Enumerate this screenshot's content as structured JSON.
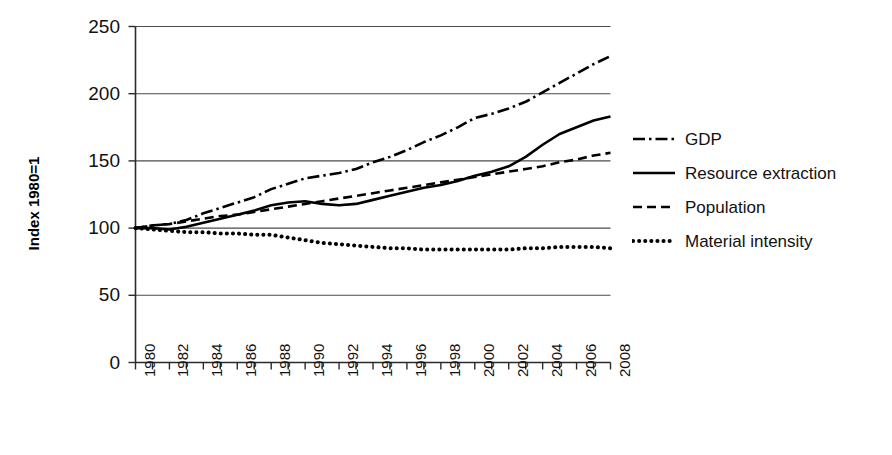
{
  "chart_data": {
    "type": "line",
    "title": "",
    "subtitle": "",
    "xlabel": "",
    "ylabel": "Index 1980=1",
    "ylim": [
      0,
      250
    ],
    "ytick_step": 50,
    "ytick_labels": [
      "0",
      "50",
      "100",
      "150",
      "200",
      "250"
    ],
    "ytick_values": [
      0,
      50,
      100,
      150,
      200,
      250
    ],
    "xlim": [
      1980,
      2008
    ],
    "xtick_labels": [
      "1980",
      "1982",
      "1984",
      "1986",
      "1988",
      "1990",
      "1992",
      "1994",
      "1996",
      "1998",
      "2000",
      "2002",
      "2004",
      "2006",
      "2008"
    ],
    "xtick_values": [
      1980,
      1982,
      1984,
      1986,
      1988,
      1990,
      1992,
      1994,
      1996,
      1998,
      2000,
      2002,
      2004,
      2006,
      2008
    ],
    "xtick_minor_step": 1,
    "xtick_label_rotation": -90,
    "grid": "horizontal",
    "legend_position": "right",
    "x": [
      1980,
      1981,
      1982,
      1983,
      1984,
      1985,
      1986,
      1987,
      1988,
      1989,
      1990,
      1991,
      1992,
      1993,
      1994,
      1995,
      1996,
      1997,
      1998,
      1999,
      2000,
      2001,
      2002,
      2003,
      2004,
      2005,
      2006,
      2007,
      2008
    ],
    "series": [
      {
        "name": "GDP",
        "style": "dash-dot",
        "color": "#000000",
        "values": [
          100,
          102,
          103,
          106,
          111,
          115,
          119,
          123,
          129,
          133,
          137,
          139,
          141,
          144,
          149,
          153,
          158,
          164,
          169,
          175,
          182,
          185,
          189,
          194,
          201,
          208,
          215,
          222,
          228
        ]
      },
      {
        "name": "Resource extraction",
        "style": "solid",
        "color": "#000000",
        "values": [
          100,
          100,
          99,
          101,
          104,
          107,
          110,
          113,
          117,
          119,
          120,
          118,
          117,
          118,
          121,
          124,
          127,
          130,
          132,
          135,
          139,
          142,
          146,
          153,
          162,
          170,
          175,
          180,
          183
        ]
      },
      {
        "name": "Population",
        "style": "dashed",
        "color": "#000000",
        "values": [
          100,
          102,
          103,
          105,
          107,
          109,
          110,
          112,
          114,
          116,
          118,
          120,
          122,
          124,
          126,
          128,
          130,
          132,
          134,
          136,
          138,
          140,
          142,
          144,
          146,
          149,
          151,
          154,
          156
        ]
      },
      {
        "name": "Material intensity",
        "style": "dotted",
        "color": "#000000",
        "values": [
          100,
          99,
          98,
          97,
          97,
          96,
          96,
          95,
          95,
          93,
          91,
          89,
          88,
          87,
          86,
          85,
          85,
          84,
          84,
          84,
          84,
          84,
          84,
          85,
          85,
          86,
          86,
          86,
          85
        ]
      }
    ]
  },
  "legend": {
    "items": [
      {
        "label": "GDP",
        "style": "dash-dot"
      },
      {
        "label": "Resource extraction",
        "style": "solid"
      },
      {
        "label": "Population",
        "style": "dashed"
      },
      {
        "label": "Material intensity",
        "style": "dotted"
      }
    ]
  },
  "axes": {
    "y_title": "Index 1980=1"
  }
}
